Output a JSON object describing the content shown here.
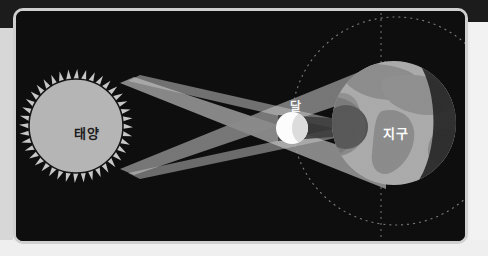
{
  "diagram": {
    "background_color": "#0d0d0d",
    "frame_color": "#cfcfcf",
    "page_color": "#ededed",
    "labels": {
      "sun": "태양",
      "moon": "달",
      "earth": "지구"
    },
    "bodies": [
      {
        "name": "sun",
        "label": "태양",
        "cx": 72,
        "cy": 118,
        "r": 48,
        "fill": "#b7b7b7",
        "stroke": "#141414",
        "corona_spikes": 40,
        "corona_length": 10
      },
      {
        "name": "moon",
        "label": "달",
        "cx": 283,
        "cy": 125,
        "r": 16,
        "fill": "#fdfdfd",
        "shade_fill": "#d8d8d8"
      },
      {
        "name": "earth",
        "label": "지구",
        "cx": 385,
        "cy": 120,
        "r": 62,
        "fill": "#a8a8a8",
        "land_fill": "#8d8d8d",
        "night_fill": "#2b2b2b"
      }
    ],
    "rays": [
      {
        "name": "upper-light-cone",
        "fill": "#9a9a9a",
        "opacity": 0.85
      },
      {
        "name": "lower-light-cone",
        "fill": "#868686",
        "opacity": 0.85
      },
      {
        "name": "penumbra-band",
        "fill": "#bdbdbd",
        "opacity": 0.8
      },
      {
        "name": "umbra-shadow",
        "fill": "#4a4a4a",
        "opacity": 0.9
      }
    ],
    "orbit": {
      "name": "moon-orbit",
      "cx": 387,
      "cy": 118,
      "r": 104,
      "stroke": "#a7a7a7",
      "dash": "2 4"
    },
    "axis": {
      "name": "orbital-axis",
      "x": 372,
      "y1": 10,
      "y2": 232,
      "stroke": "#9e9e9e",
      "dash": "2 4"
    },
    "crossing_point": {
      "x": 218,
      "y": 128
    }
  }
}
